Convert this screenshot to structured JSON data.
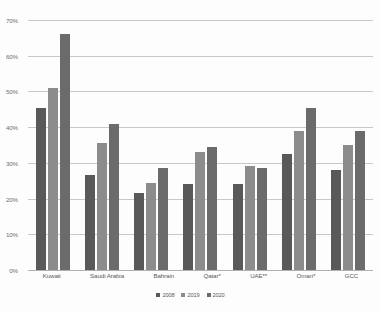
{
  "chart_data": {
    "type": "bar",
    "title": "",
    "xlabel": "",
    "ylabel": "",
    "ylim": [
      0,
      70
    ],
    "ytick_labels": [
      "0%",
      "10%",
      "20%",
      "30%",
      "40%",
      "50%",
      "60%",
      "70%"
    ],
    "ytick_values": [
      0,
      10,
      20,
      30,
      40,
      50,
      60,
      70
    ],
    "grid": true,
    "legend_position": "bottom",
    "categories": [
      "Kuwait",
      "Saudi Arabia",
      "Bahrain",
      "Qatar*",
      "UAE**",
      "Oman*",
      "GCC"
    ],
    "series": [
      {
        "name": "2008",
        "color": "#595959",
        "values": [
          45.5,
          26.5,
          21.5,
          24.0,
          24.0,
          32.5,
          28.0
        ]
      },
      {
        "name": "2019",
        "color": "#8c8c8c",
        "values": [
          51.0,
          35.5,
          24.5,
          33.0,
          29.0,
          39.0,
          35.0
        ]
      },
      {
        "name": "2020",
        "color": "#6b6b6b",
        "values": [
          66.0,
          41.0,
          28.5,
          34.5,
          28.5,
          45.5,
          39.0
        ]
      }
    ]
  }
}
